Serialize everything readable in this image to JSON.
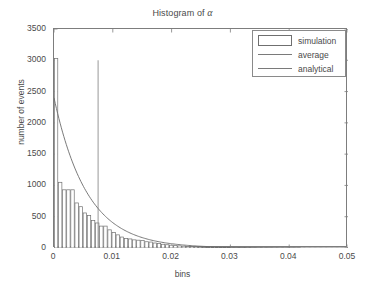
{
  "chart_data": {
    "type": "bar",
    "title": "Histogram of α",
    "title_prefix": "Histogram of ",
    "title_symbol": "α",
    "xlabel": "bins",
    "ylabel": "number of events",
    "xlim": [
      0,
      0.05
    ],
    "ylim": [
      0,
      3500
    ],
    "xticks": [
      0,
      0.01,
      0.02,
      0.03,
      0.04,
      0.05
    ],
    "xtick_labels": [
      "0",
      "0.01",
      "0.02",
      "0.03",
      "0.04",
      "0.05"
    ],
    "yticks": [
      0,
      500,
      1000,
      1500,
      2000,
      2500,
      3000,
      3500
    ],
    "ytick_labels": [
      "0",
      "500",
      "1000",
      "1500",
      "2000",
      "2500",
      "3000",
      "3500"
    ],
    "grid": false,
    "legend_position": "top-right",
    "legend": [
      "simulation",
      "average",
      "analytical"
    ],
    "bin_width": 0.0007,
    "categories": [
      0.00035,
      0.00105,
      0.00175,
      0.00245,
      0.00315,
      0.00385,
      0.00455,
      0.00525,
      0.00595,
      0.00665,
      0.00735,
      0.00805,
      0.00875,
      0.00945,
      0.01015,
      0.01085,
      0.01155,
      0.01225,
      0.01295,
      0.01365,
      0.01435,
      0.01505,
      0.01575,
      0.01645,
      0.01715,
      0.01785,
      0.01855,
      0.01925,
      0.01995,
      0.02065,
      0.02135,
      0.02205,
      0.02275,
      0.02345,
      0.02415,
      0.02485,
      0.02555,
      0.02625,
      0.02695,
      0.02765,
      0.02835,
      0.02905,
      0.02975,
      0.03045,
      0.03115,
      0.03185,
      0.03255,
      0.03325,
      0.03395,
      0.03465,
      0.03535,
      0.03605,
      0.03675,
      0.03745,
      0.03815,
      0.03885,
      0.03955,
      0.04025,
      0.04095,
      0.04165,
      0.04235,
      0.04305,
      0.04375,
      0.04445
    ],
    "series": [
      {
        "name": "simulation",
        "type": "bar",
        "values": [
          3030,
          1050,
          930,
          930,
          930,
          720,
          660,
          560,
          520,
          440,
          400,
          350,
          350,
          290,
          250,
          210,
          175,
          150,
          145,
          130,
          125,
          120,
          100,
          95,
          80,
          70,
          60,
          52,
          45,
          40,
          34,
          30,
          26,
          22,
          20,
          17,
          14,
          12,
          10,
          9,
          8,
          7,
          6,
          5,
          5,
          4,
          4,
          3,
          3,
          2,
          2,
          2,
          2,
          1,
          1,
          1,
          1,
          1,
          1,
          1,
          0,
          0,
          0,
          0
        ]
      },
      {
        "name": "analytical",
        "type": "line",
        "x": [
          0,
          0.0025,
          0.005,
          0.0075,
          0.01,
          0.0125,
          0.015,
          0.0175,
          0.02,
          0.0225,
          0.025,
          0.0275,
          0.03,
          0.0325,
          0.035,
          0.0375,
          0.04,
          0.045,
          0.05
        ],
        "y": [
          2400,
          1720,
          1230,
          880,
          630,
          455,
          325,
          235,
          168,
          120,
          86,
          62,
          44,
          32,
          23,
          16,
          12,
          6,
          3
        ]
      },
      {
        "name": "average",
        "type": "vline",
        "x": 0.0075,
        "y_top": 3000,
        "y_bottom": 0
      }
    ]
  },
  "colors": {
    "axis": "#7d7d7d",
    "bar_edge": "#6f6f6f",
    "bar_fill": "#ffffff",
    "curve": "#6b6b6b",
    "vline": "#8c8c8c",
    "text": "#4a4a4a",
    "background": "#ffffff"
  }
}
